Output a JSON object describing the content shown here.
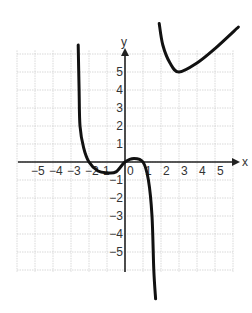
{
  "chart_data": {
    "type": "line",
    "title": "",
    "xlabel": "x",
    "ylabel": "y",
    "xlim": [
      -6,
      6
    ],
    "ylim": [
      -6,
      6
    ],
    "grid": true,
    "x_ticks": [
      -5,
      -4,
      -3,
      -2,
      -1,
      0,
      1,
      2,
      3,
      4,
      5
    ],
    "x_tick_labels": [
      "-5",
      "-4",
      "-3",
      "-2",
      "1",
      "0",
      "1",
      "2",
      "3",
      "4",
      "5"
    ],
    "y_ticks": [
      5,
      4,
      3,
      2,
      1,
      -1,
      -2,
      -3,
      -4,
      -5
    ],
    "y_tick_labels": [
      "5",
      "4",
      "3",
      "2",
      "1",
      "-1",
      "-2",
      "-3",
      "-4",
      "-5"
    ],
    "series": [
      {
        "name": "left-middle branch",
        "points": [
          [
            -2.6,
            6.5
          ],
          [
            -2.55,
            4.0
          ],
          [
            -2.5,
            2.0
          ],
          [
            -2.3,
            0.8
          ],
          [
            -2.0,
            0.0
          ],
          [
            -1.5,
            -0.5
          ],
          [
            -1.0,
            -0.6
          ],
          [
            -0.5,
            -0.55
          ],
          [
            0.0,
            0.0
          ],
          [
            0.5,
            0.2
          ],
          [
            1.0,
            0.0
          ],
          [
            1.3,
            -1.0
          ],
          [
            1.5,
            -3.0
          ],
          [
            1.6,
            -6.0
          ],
          [
            1.7,
            -7.6
          ]
        ]
      },
      {
        "name": "upper-right branch",
        "points": [
          [
            1.9,
            7.7
          ],
          [
            2.1,
            6.5
          ],
          [
            2.5,
            5.5
          ],
          [
            3.0,
            5.0
          ],
          [
            4.0,
            5.5
          ],
          [
            5.0,
            6.3
          ],
          [
            6.3,
            7.5
          ]
        ]
      }
    ],
    "annotations": {
      "local_min_upper_branch": [
        3,
        5
      ],
      "x_intercepts": [
        -2,
        0,
        1
      ]
    }
  },
  "axes": {
    "x_label": "x",
    "y_label": "y",
    "x_tick_text": [
      "−5",
      "−4",
      "−3",
      "−2",
      "1",
      "0",
      "1",
      "2",
      "3",
      "4",
      "5"
    ],
    "y_tick_text": [
      "5",
      "4",
      "3",
      "2",
      "1",
      "−1",
      "−2",
      "−3",
      "−4",
      "−5"
    ]
  }
}
